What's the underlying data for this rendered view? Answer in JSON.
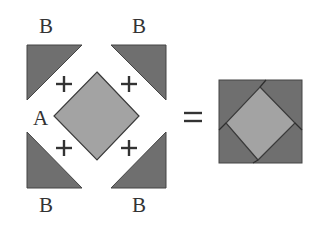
{
  "diagram": {
    "labels": {
      "b_top_left": "B",
      "b_top_right": "B",
      "b_bottom_left": "B",
      "b_bottom_right": "B",
      "a_center": "A"
    },
    "operators": {
      "plus": "+",
      "equals": "="
    },
    "pieces": [
      {
        "id": "triangle-b-top-left",
        "label": "B",
        "shape": "right-triangle"
      },
      {
        "id": "triangle-b-top-right",
        "label": "B",
        "shape": "right-triangle"
      },
      {
        "id": "triangle-b-bottom-left",
        "label": "B",
        "shape": "right-triangle"
      },
      {
        "id": "triangle-b-bottom-right",
        "label": "B",
        "shape": "right-triangle"
      },
      {
        "id": "square-a-diamond",
        "label": "A",
        "shape": "square-rotated-45"
      }
    ],
    "result": "square-in-a-square block",
    "colors": {
      "triangle_fill": "#6f6f6f",
      "diamond_fill": "#a3a3a3",
      "outline": "#3a3a3a",
      "text": "#333333",
      "background": "#ffffff"
    }
  }
}
